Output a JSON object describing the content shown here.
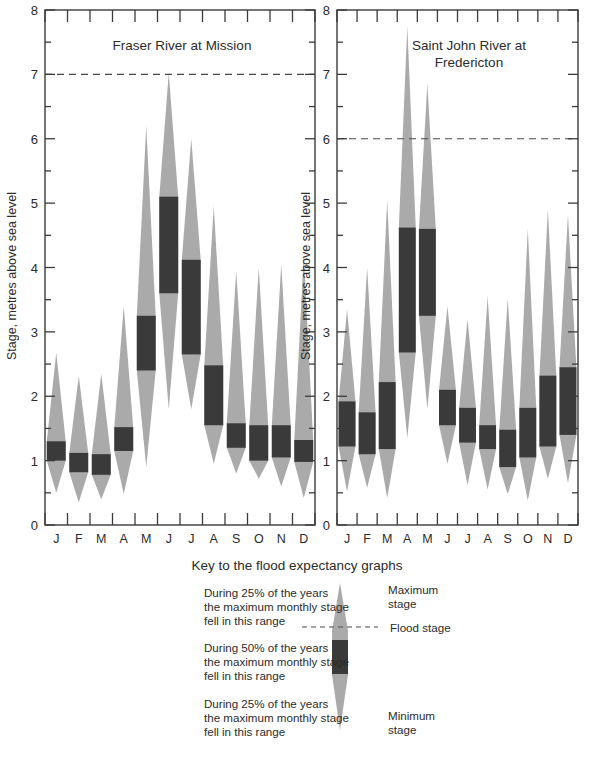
{
  "figure": {
    "background": "#ffffff",
    "colors": {
      "light_band": "#aaaaaa",
      "dark_band": "#3a3a3a",
      "axis": "#3b3b3b",
      "text": "#2b2b2b"
    }
  },
  "axis": {
    "ylabel": "Stage, metres above sea level",
    "yticks": [
      "0",
      "1",
      "2",
      "3",
      "4",
      "5",
      "6",
      "7",
      "8"
    ],
    "ylim": [
      0,
      8
    ],
    "minor_tick_step": 0.5,
    "months": [
      "J",
      "F",
      "M",
      "A",
      "M",
      "J",
      "J",
      "A",
      "S",
      "O",
      "N",
      "D"
    ]
  },
  "key": {
    "title": "Key to the flood expectancy graphs",
    "upper_quartile_text": "During 25% of the years\nthe maximum monthly stage\nfell in this range",
    "interquartile_text": "During 50% of the years\nthe maximum monthly stage\nfell in this range",
    "lower_quartile_text": "During 25% of the years\nthe maximum monthly stage\nfell in this range",
    "max_label": "Maximum\nstage",
    "flood_label": "Flood stage",
    "min_label": "Minimum\nstage"
  },
  "chart_data": [
    {
      "type": "bar",
      "id": "fraser",
      "title": "Fraser River at Mission",
      "xlabel": "",
      "ylabel": "Stage, metres above sea level",
      "ylim": [
        0,
        8
      ],
      "grid": false,
      "flood_stage": 7.0,
      "categories": [
        "J",
        "F",
        "M",
        "A",
        "M",
        "J",
        "J",
        "A",
        "S",
        "O",
        "N",
        "D"
      ],
      "series": [
        {
          "name": "minimum stage",
          "values": [
            0.5,
            0.35,
            0.4,
            0.48,
            0.9,
            1.8,
            1.8,
            0.95,
            0.8,
            0.72,
            0.6,
            0.42
          ]
        },
        {
          "name": "lower quartile (25%)",
          "values": [
            1.0,
            0.82,
            0.78,
            1.15,
            2.4,
            3.6,
            2.65,
            1.55,
            1.2,
            1.0,
            1.05,
            0.98
          ]
        },
        {
          "name": "upper quartile (75%)",
          "values": [
            1.3,
            1.12,
            1.1,
            1.52,
            3.25,
            5.1,
            4.12,
            2.48,
            1.58,
            1.55,
            1.55,
            1.32
          ]
        },
        {
          "name": "maximum stage",
          "values": [
            2.68,
            2.32,
            2.35,
            3.4,
            6.2,
            7.02,
            6.0,
            4.95,
            3.95,
            4.0,
            4.05,
            4.2
          ]
        }
      ]
    },
    {
      "type": "bar",
      "id": "saintjohn",
      "title": "Saint John River at\nFredericton",
      "xlabel": "",
      "ylabel": "Stage, metres above sea level",
      "ylim": [
        0,
        8
      ],
      "grid": false,
      "flood_stage": 6.0,
      "categories": [
        "J",
        "F",
        "M",
        "A",
        "M",
        "J",
        "J",
        "A",
        "S",
        "O",
        "N",
        "D"
      ],
      "series": [
        {
          "name": "minimum stage",
          "values": [
            0.52,
            0.58,
            0.42,
            1.35,
            1.8,
            0.95,
            0.62,
            0.55,
            0.48,
            0.38,
            0.72,
            0.65
          ]
        },
        {
          "name": "lower quartile (25%)",
          "values": [
            1.22,
            1.1,
            1.18,
            2.68,
            3.25,
            1.55,
            1.28,
            1.18,
            0.9,
            1.05,
            1.22,
            1.4
          ]
        },
        {
          "name": "upper quartile (75%)",
          "values": [
            1.92,
            1.75,
            2.22,
            4.62,
            4.6,
            2.1,
            1.82,
            1.55,
            1.48,
            1.82,
            2.32,
            2.45
          ]
        },
        {
          "name": "maximum stage",
          "values": [
            3.35,
            4.0,
            5.05,
            7.75,
            6.85,
            3.4,
            3.2,
            3.55,
            3.52,
            4.6,
            4.9,
            4.82
          ]
        }
      ]
    }
  ]
}
